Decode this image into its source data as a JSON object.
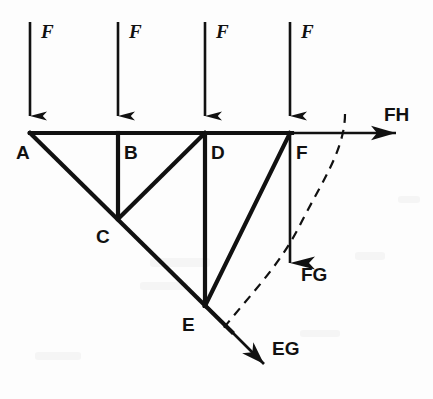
{
  "diagram": {
    "background_color": "#fdfdfd",
    "line_color": "#111111"
  },
  "nodes": [
    {
      "id": "A",
      "label": "A",
      "x": 30,
      "y": 133,
      "label_x": 16,
      "label_y": 159
    },
    {
      "id": "B",
      "label": "B",
      "x": 118,
      "y": 133,
      "label_x": 124,
      "label_y": 159
    },
    {
      "id": "C",
      "label": "C",
      "x": 118,
      "y": 218,
      "label_x": 96,
      "label_y": 243
    },
    {
      "id": "D",
      "label": "D",
      "x": 205,
      "y": 133,
      "label_x": 211,
      "label_y": 159
    },
    {
      "id": "E",
      "label": "E",
      "x": 205,
      "y": 305,
      "label_x": 182,
      "label_y": 331
    },
    {
      "id": "F",
      "label": "F",
      "x": 290,
      "y": 133,
      "label_x": 296,
      "label_y": 159
    }
  ],
  "members": [
    {
      "name": "top-chord-A-F",
      "from": "A",
      "to": "F"
    },
    {
      "name": "diagonal-A-E",
      "from": "A",
      "to": "E"
    },
    {
      "name": "vertical-B-C",
      "from": "B",
      "to": "C"
    },
    {
      "name": "diagonal-C-D",
      "from": "C",
      "to": "D"
    },
    {
      "name": "vertical-D-E",
      "from": "D",
      "to": "E"
    },
    {
      "name": "diagonal-E-F",
      "from": "E",
      "to": "F"
    }
  ],
  "applied_loads": [
    {
      "name": "load-at-A",
      "label": "F",
      "x": 30,
      "top_y": 22,
      "tip_y": 131,
      "label_x": 41,
      "label_y": 38
    },
    {
      "name": "load-at-B",
      "label": "F",
      "x": 118,
      "top_y": 22,
      "tip_y": 131,
      "label_x": 129,
      "label_y": 38
    },
    {
      "name": "load-at-D",
      "label": "F",
      "x": 205,
      "top_y": 22,
      "tip_y": 131,
      "label_x": 216,
      "label_y": 38
    },
    {
      "name": "load-at-F",
      "label": "F",
      "x": 290,
      "top_y": 22,
      "tip_y": 131,
      "label_x": 301,
      "label_y": 38
    }
  ],
  "internal_forces": [
    {
      "name": "force-FH",
      "label": "FH",
      "direction": "horizontal-right",
      "start": {
        "x": 291,
        "y": 133
      },
      "end": {
        "x": 420,
        "y": 133
      },
      "label_x": 384,
      "label_y": 121
    },
    {
      "name": "force-FG",
      "label": "FG",
      "direction": "vertical-down",
      "start": {
        "x": 290,
        "y": 134
      },
      "end": {
        "x": 290,
        "y": 288
      },
      "label_x": 301,
      "label_y": 281
    },
    {
      "name": "force-EG",
      "label": "EG",
      "direction": "diagonal-down-right",
      "start": {
        "x": 206,
        "y": 306
      },
      "end": {
        "x": 280,
        "y": 380
      },
      "label_x": 272,
      "label_y": 355
    }
  ],
  "section_cut": {
    "name": "section-cut-curve",
    "style": "dashed",
    "description": "dashed cut line crossing members FH, FG and EG",
    "path": "M 345 114 C 345 150, 320 185, 300 225 C 280 265, 250 295, 222 330"
  }
}
